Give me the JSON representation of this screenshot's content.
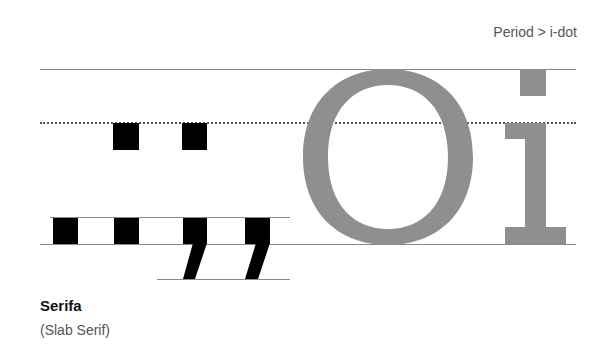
{
  "caption": "Period > i-dot",
  "title": "Serifa",
  "subtitle": "(Slab Serif)",
  "glyphs": {
    "large_letters": "Oi",
    "punctuation": [
      ". . . (colon dots)",
      "period",
      "period",
      "comma",
      "comma"
    ]
  },
  "colors": {
    "punctuation": "#000000",
    "letters": "#8f8f8f",
    "guides": "#8a8a8a"
  }
}
